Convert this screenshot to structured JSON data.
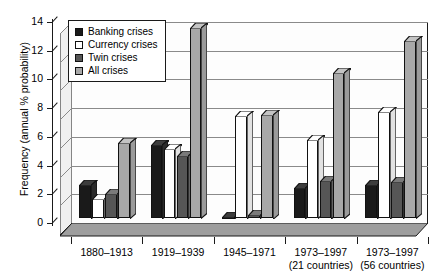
{
  "chart_data": {
    "type": "bar",
    "title": "",
    "xlabel": "",
    "ylabel": "Frequency (annual % probability)",
    "ylim": [
      0,
      14
    ],
    "ytick_values": [
      0,
      2,
      4,
      6,
      8,
      10,
      12,
      14
    ],
    "ytick_labels": [
      "0",
      "2",
      "4",
      "6",
      "8",
      "10",
      "12",
      "14"
    ],
    "grid": true,
    "legend_position": "upper-left-inside",
    "categories": [
      "1880–1913",
      "1919–1939",
      "1945–1971",
      "1973–1997",
      "1973–1997"
    ],
    "category_sublabels": [
      "",
      "",
      "",
      "(21 countries)",
      "(56 countries)"
    ],
    "series": [
      {
        "name": "Banking crises",
        "color": "#1a1a1a",
        "values": [
          2.3,
          5.1,
          0.1,
          2.1,
          2.3
        ]
      },
      {
        "name": "Currency crises",
        "color": "#ffffff",
        "values": [
          1.3,
          4.8,
          7.1,
          5.4,
          7.4
        ]
      },
      {
        "name": "Twin crises",
        "color": "#565656",
        "values": [
          1.7,
          4.3,
          0.2,
          2.6,
          2.5
        ]
      },
      {
        "name": "All crises",
        "color": "#a8a8a8",
        "values": [
          5.2,
          13.2,
          7.2,
          10.1,
          12.3
        ]
      }
    ]
  },
  "legend": {
    "items": [
      {
        "label": "Banking crises"
      },
      {
        "label": "Currency crises"
      },
      {
        "label": "Twin crises"
      },
      {
        "label": "All crises"
      }
    ]
  }
}
